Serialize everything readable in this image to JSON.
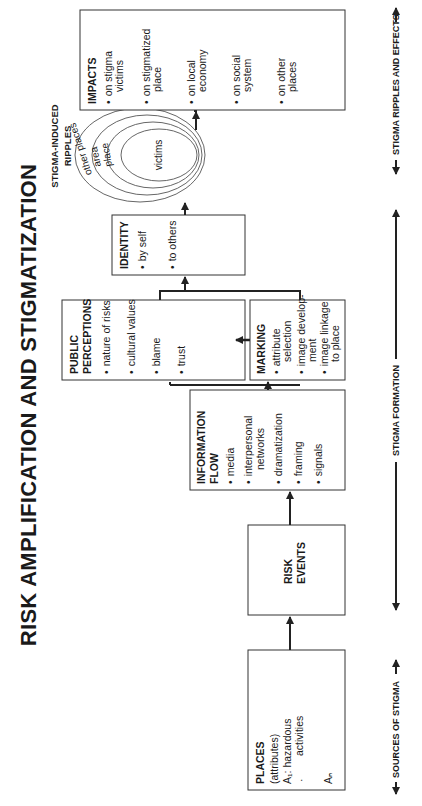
{
  "title": "RISK AMPLIFICATION AND STIGMATIZATION",
  "boxes": {
    "places": {
      "heading": "PLACES",
      "lines": [
        "(attributes)",
        "A₁: hazardous",
        "activities",
        "·",
        "Aₙ"
      ]
    },
    "risk_events": {
      "heading_1": "RISK",
      "heading_2": "EVENTS"
    },
    "information_flow": {
      "heading_1": "INFORMATION",
      "heading_2": "FLOW",
      "items": [
        "media",
        "interpersonal",
        "networks",
        "dramatization",
        "framing",
        "signals"
      ]
    },
    "public_perceptions": {
      "heading_1": "PUBLIC",
      "heading_2": "PERCEPTIONS",
      "items": [
        "nature of risks",
        "cultural values",
        "blame",
        "trust"
      ]
    },
    "marking": {
      "heading": "MARKING",
      "items": [
        "attribute",
        "selection",
        "image develop-",
        "ment",
        "image linkage",
        "to place",
        "labeling"
      ]
    },
    "identity": {
      "heading": "IDENTITY",
      "items": [
        "by self",
        "to others"
      ]
    },
    "impacts": {
      "heading": "IMPACTS",
      "items": [
        "on stigma",
        "victims",
        "on stigmatized",
        "place",
        "on local",
        "economy",
        "on social",
        "system",
        "on other",
        "places"
      ]
    }
  },
  "ripples": {
    "label_1": "STIGMA-INDUCED",
    "label_2": "RIPPLES",
    "rings": [
      "other places",
      "area",
      "place",
      "victims"
    ]
  },
  "bands": {
    "sources": "SOURCES OF STIGMA",
    "formation": "STIGMA FORMATION",
    "ripples_effects": "STIGMA RIPPLES AND EFFECTS"
  },
  "bullet": "•"
}
